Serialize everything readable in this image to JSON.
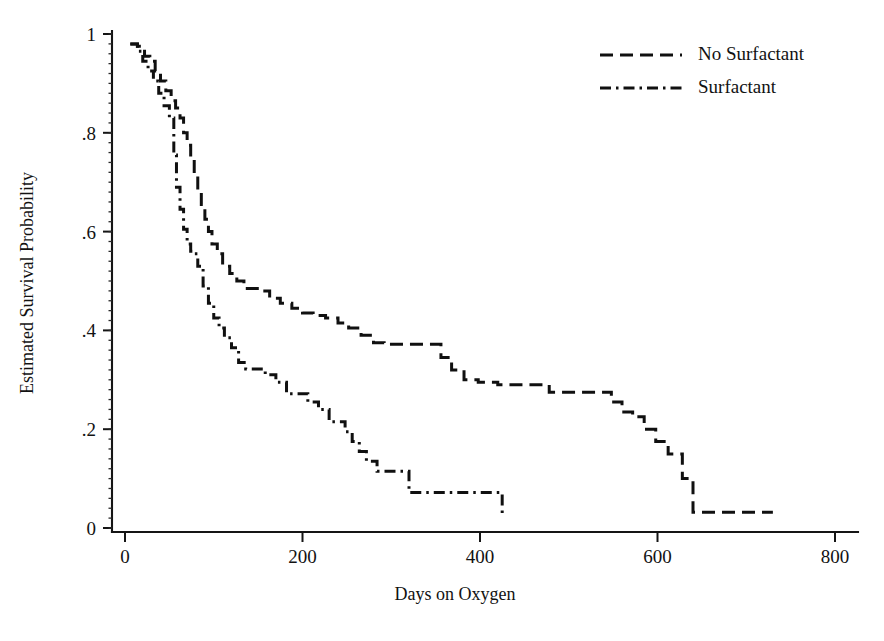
{
  "chart_data": {
    "type": "line",
    "subtype": "kaplan-meier-step",
    "title": "",
    "xlabel": "Days on Oxygen",
    "ylabel": "Estimated Survival Probability",
    "xlim": [
      0,
      800
    ],
    "ylim": [
      0,
      1
    ],
    "xticks": [
      0,
      200,
      400,
      600,
      800
    ],
    "xtick_labels": [
      "0",
      "200",
      "400",
      "600",
      "800"
    ],
    "yticks": [
      0,
      0.2,
      0.4,
      0.6,
      0.8,
      1
    ],
    "ytick_labels": [
      "0",
      ".2",
      ".4",
      ".6",
      ".8",
      "1"
    ],
    "grid": false,
    "legend_position": "top-right",
    "line_color": "#101010",
    "background_color": "#ffffff",
    "series": [
      {
        "name": "No Surfactant",
        "linestyle": "dashed",
        "x": [
          6,
          14,
          22,
          28,
          34,
          40,
          46,
          52,
          57,
          62,
          66,
          70,
          74,
          78,
          82,
          86,
          90,
          94,
          98,
          104,
          110,
          118,
          126,
          134,
          142,
          152,
          163,
          175,
          188,
          200,
          212,
          226,
          240,
          252,
          266,
          280,
          292,
          306,
          320,
          345,
          356,
          368,
          382,
          398,
          420,
          450,
          478,
          500,
          520,
          540,
          548,
          560,
          572,
          585,
          598,
          612,
          628,
          640,
          680,
          730
        ],
        "y": [
          0.98,
          0.975,
          0.955,
          0.945,
          0.925,
          0.905,
          0.885,
          0.865,
          0.85,
          0.83,
          0.8,
          0.775,
          0.745,
          0.715,
          0.685,
          0.655,
          0.625,
          0.6,
          0.575,
          0.555,
          0.53,
          0.515,
          0.5,
          0.485,
          0.485,
          0.48,
          0.465,
          0.455,
          0.445,
          0.435,
          0.43,
          0.425,
          0.415,
          0.405,
          0.39,
          0.375,
          0.372,
          0.372,
          0.372,
          0.372,
          0.345,
          0.32,
          0.3,
          0.295,
          0.29,
          0.29,
          0.275,
          0.275,
          0.275,
          0.275,
          0.255,
          0.235,
          0.225,
          0.2,
          0.175,
          0.15,
          0.1,
          0.032,
          0.032,
          0.032
        ]
      },
      {
        "name": "Surfactant",
        "linestyle": "dashdot",
        "x": [
          6,
          14,
          20,
          26,
          32,
          38,
          44,
          50,
          55,
          58,
          62,
          66,
          70,
          74,
          78,
          82,
          88,
          94,
          100,
          106,
          112,
          120,
          128,
          136,
          146,
          158,
          170,
          182,
          194,
          206,
          218,
          230,
          240,
          248,
          256,
          264,
          272,
          284,
          296,
          308,
          320,
          360,
          400,
          424,
          425
        ],
        "y": [
          0.98,
          0.965,
          0.945,
          0.925,
          0.905,
          0.88,
          0.855,
          0.83,
          0.755,
          0.69,
          0.645,
          0.605,
          0.575,
          0.56,
          0.555,
          0.53,
          0.49,
          0.455,
          0.425,
          0.405,
          0.385,
          0.365,
          0.335,
          0.322,
          0.322,
          0.31,
          0.295,
          0.272,
          0.272,
          0.255,
          0.24,
          0.215,
          0.215,
          0.195,
          0.175,
          0.155,
          0.135,
          0.115,
          0.115,
          0.115,
          0.072,
          0.072,
          0.072,
          0.072,
          0.02
        ]
      }
    ],
    "legend_entries": [
      {
        "label": "No Surfactant",
        "linestyle": "dashed"
      },
      {
        "label": "Surfactant",
        "linestyle": "dashdot"
      }
    ]
  }
}
